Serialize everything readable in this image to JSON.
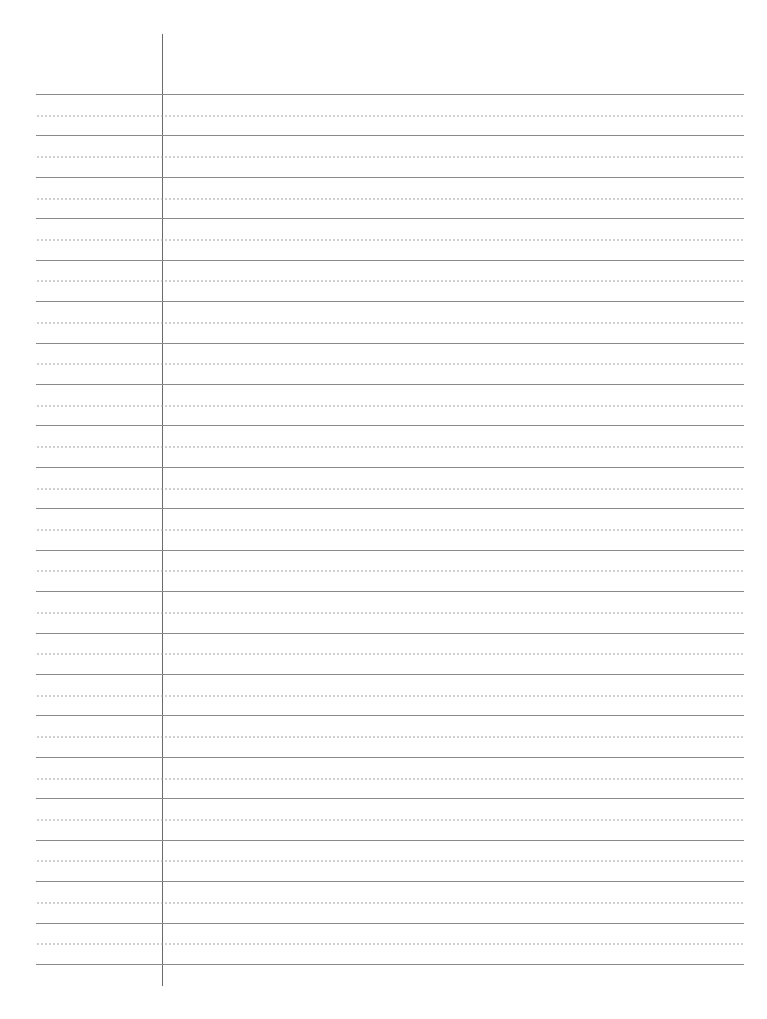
{
  "paper": {
    "type": "lined-writing-paper",
    "background_color": "#ffffff",
    "rule_color": "#8a8a8a",
    "dotted_color": "#9a9a9a",
    "margin_line_color": "#6a6a6a",
    "solid_line_count": 22,
    "dotted_line_count": 21,
    "first_rule_y": 94,
    "line_spacing": 41.43,
    "margin_x": 162
  }
}
